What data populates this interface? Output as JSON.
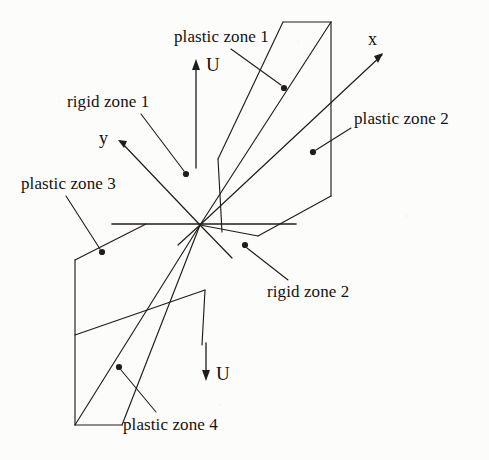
{
  "figure": {
    "name": "plastic-rigid-zone-diagram",
    "ink_color": "#201c1a",
    "background_color": "#fcfcfa",
    "origin": {
      "x": 200,
      "y": 225
    }
  },
  "axes": [
    {
      "key": "x",
      "label": "x",
      "label_x": 368,
      "label_y": 30,
      "tip_x": 383,
      "tip_y": 54
    },
    {
      "key": "y",
      "label": "y",
      "label_x": 99,
      "label_y": 129,
      "tip_x": 119,
      "tip_y": 140
    }
  ],
  "displacement": [
    {
      "key": "u_top",
      "label": "U",
      "label_x": 206,
      "label_y": 55,
      "direction": "up"
    },
    {
      "key": "u_bottom",
      "label": "U",
      "label_x": 216,
      "label_y": 364,
      "direction": "down"
    }
  ],
  "annotations": [
    {
      "key": "plastic-zone-1",
      "label": "plastic zone 1",
      "label_x": 174,
      "label_y": 28,
      "dot_x": 284,
      "dot_y": 88,
      "leader_x": 231,
      "leader_y": 49
    },
    {
      "key": "plastic-zone-2",
      "label": "plastic zone 2",
      "label_x": 354,
      "label_y": 110,
      "dot_x": 313,
      "dot_y": 152,
      "leader_x": 351,
      "leader_y": 128
    },
    {
      "key": "plastic-zone-3",
      "label": "plastic zone 3",
      "label_x": 21,
      "label_y": 175,
      "dot_x": 102,
      "dot_y": 252,
      "leader_x": 66,
      "leader_y": 196
    },
    {
      "key": "plastic-zone-4",
      "label": "plastic zone 4",
      "label_x": 123,
      "label_y": 416,
      "dot_x": 119,
      "dot_y": 367,
      "leader_x": 156,
      "leader_y": 412
    },
    {
      "key": "rigid-zone-1",
      "label": "rigid zone 1",
      "label_x": 67,
      "label_y": 93,
      "dot_x": 186,
      "dot_y": 174,
      "leader_x": 141,
      "leader_y": 114
    },
    {
      "key": "rigid-zone-2",
      "label": "rigid zone 2",
      "label_x": 267,
      "label_y": 283,
      "dot_x": 245,
      "dot_y": 245,
      "leader_x": 288,
      "leader_y": 280
    }
  ],
  "geometry": {
    "upper_plane": "M200,225 L283,22 L331,22 L331,196 L200,225 Z",
    "lower_plane": "M200,225 L122,425 L75,425 L75,260 L200,225 Z",
    "horizontal_line": {
      "x1": 112,
      "y1": 224,
      "x2": 296,
      "y2": 224
    },
    "diagonal_upper": {
      "x1": 200,
      "y1": 225,
      "x2": 331,
      "y2": 22
    },
    "diagonal_lower": {
      "x1": 200,
      "y1": 225,
      "x2": 75,
      "y2": 425
    }
  }
}
